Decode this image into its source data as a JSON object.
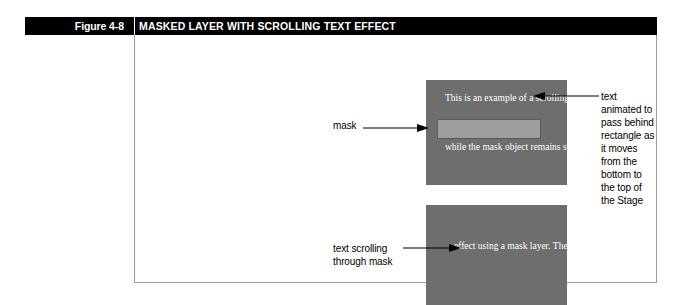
{
  "header": {
    "figure_number": "Figure 4-8",
    "title": "MASKED LAYER WITH SCROLLING TEXT EFFECT",
    "bar_color": "#000000",
    "text_color": "#ffffff"
  },
  "figure": {
    "frame_border_color": "#9a9a9a",
    "background": "#ffffff"
  },
  "stage_top": {
    "background_color": "#6e6e6e",
    "text_color": "#ffffff",
    "line_1": "This is an example\nof a scrolling text",
    "line_2": "while the mask object\nremains stationary.",
    "mask_rectangle": {
      "fill": "#9d9d9d",
      "border": "#5a5a5a"
    }
  },
  "stage_bottom": {
    "background_color": "#6e6e6e",
    "text_color": "#ffffff",
    "text": "effect using a mask\nlayer. The text moves"
  },
  "callouts": {
    "mask": "mask",
    "text_animated": "text animated to pass behind\nrectangle as it moves from the\nbottom to the top of the Stage",
    "text_scrolling": "text scrolling\nthrough mask"
  }
}
